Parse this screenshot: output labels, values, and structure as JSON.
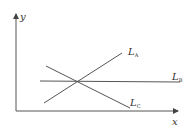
{
  "diagram": {
    "axes": {
      "x_label": "x",
      "y_label": "y"
    },
    "lines": [
      {
        "id": "LA",
        "label_main": "L",
        "label_sub": "A",
        "description": "upward sloping line"
      },
      {
        "id": "LB",
        "label_main": "L",
        "label_sub": "B",
        "description": "horizontal line"
      },
      {
        "id": "LC",
        "label_main": "L",
        "label_sub": "C",
        "description": "downward sloping line"
      }
    ],
    "intersection": "all three lines meet at a single point",
    "colors": {
      "stroke": "#555555",
      "text": "#333333",
      "background": "#ffffff"
    }
  }
}
